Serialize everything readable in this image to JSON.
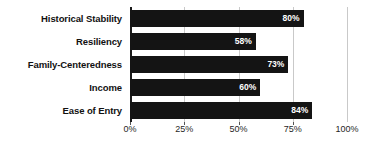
{
  "chart_data": {
    "type": "bar",
    "orientation": "horizontal",
    "title": "",
    "xlabel": "",
    "ylabel": "",
    "categories": [
      "Historical Stability",
      "Resiliency",
      "Family-Centeredness",
      "Income",
      "Ease of Entry"
    ],
    "values": [
      80,
      58,
      73,
      60,
      84
    ],
    "value_labels": [
      "80%",
      "58%",
      "73%",
      "60%",
      "84%"
    ],
    "xlim": [
      0,
      100
    ],
    "xticks": [
      0,
      25,
      50,
      75,
      100
    ],
    "xtick_labels": [
      "0%",
      "25%",
      "50%",
      "75%",
      "100%"
    ],
    "grid": true,
    "legend": null,
    "colors": {
      "bar": "#141414",
      "value_text": "#ffffff",
      "category_text": "#111111",
      "axis": "#1a1a1a",
      "gridline": "#c9c9c9",
      "background": "#ffffff"
    }
  }
}
